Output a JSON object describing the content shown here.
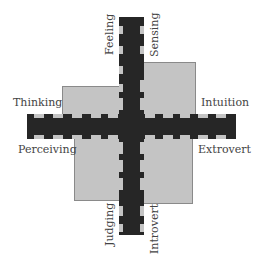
{
  "diagram": {
    "title": "",
    "colors": {
      "bar": "#262626",
      "quadrant_fill": "#c4c4c4",
      "quadrant_border": "#8a8a8a",
      "label": "#444444",
      "background": "#ffffff"
    },
    "labels": {
      "top_left": "Feeling",
      "top_right": "Sensing",
      "left_upper": "Thinking",
      "right_upper": "Intuition",
      "left_lower": "Perceiving",
      "right_lower": "Extrovert",
      "bottom_left": "Judging",
      "bottom_right": "Introvert"
    },
    "quadrants": [
      {
        "name": "Thinking",
        "position": "upper-left",
        "relative_size": "small"
      },
      {
        "name": "Sensing/Intuition",
        "position": "upper-right",
        "relative_size": "large"
      },
      {
        "name": "Perceiving",
        "position": "lower-left",
        "relative_size": "medium"
      },
      {
        "name": "Extrovert",
        "position": "lower-right",
        "relative_size": "medium"
      }
    ]
  }
}
